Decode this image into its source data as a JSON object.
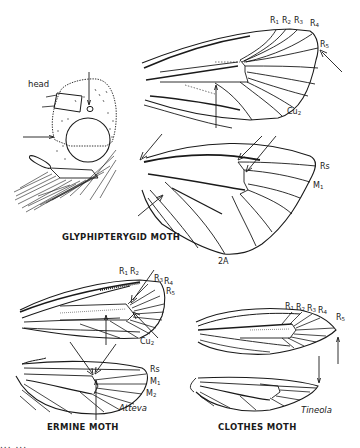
{
  "figure": {
    "type": "wing venation illustration",
    "panels": [
      {
        "id": "glyphipterygid",
        "caption": "GLYPHIPTERYGID MOTH",
        "head_label": "head",
        "forewing_labels": [
          "R1",
          "R2",
          "R3",
          "R4",
          "R5",
          "Cu2"
        ],
        "hindwing_labels": [
          "Rs",
          "M1",
          "2A"
        ]
      },
      {
        "id": "ermine",
        "caption": "ERMINE MOTH",
        "genus": "Atteva",
        "forewing_labels": [
          "R1",
          "R2",
          "R3",
          "R4",
          "R5",
          "Cu2"
        ],
        "hindwing_labels": [
          "Rs",
          "M1",
          "M2"
        ]
      },
      {
        "id": "clothes",
        "caption": "CLOTHES MOTH",
        "genus": "Tineola",
        "forewing_labels": [
          "R1",
          "R2",
          "R3",
          "R4",
          "R5"
        ],
        "hindwing_labels": []
      }
    ]
  },
  "labels": {
    "head": "head",
    "glyph_caption": "GLYPHIPTERYGID MOTH",
    "ermine_caption": "ERMINE MOTH",
    "clothes_caption": "CLOTHES MOTH",
    "ermine_genus": "Atteva",
    "clothes_genus": "Tineola",
    "R": "R",
    "Cu": "Cu",
    "M": "M",
    "A": "A",
    "n1": "1",
    "n2": "2",
    "n3": "3",
    "n4": "4",
    "n5": "5",
    "Rs": "Rs",
    "twoA": "2A"
  },
  "bottom_text_partial": "... ..."
}
